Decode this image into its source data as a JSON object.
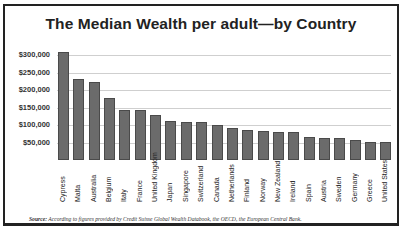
{
  "chart_data": {
    "type": "bar",
    "title": "The Median Wealth per adult—by Country",
    "xlabel": "",
    "ylabel": "",
    "ylim": [
      0,
      300000
    ],
    "yticks": [
      "$50,000",
      "$100,000",
      "$150,000",
      "$200,000",
      "$250,000",
      "$300,000"
    ],
    "ytick_values": [
      50000,
      100000,
      150000,
      200000,
      250000,
      300000
    ],
    "grid": true,
    "legend": null,
    "categories": [
      "Cypress",
      "Malta",
      "Australia",
      "Belgium",
      "Italy",
      "France",
      "United Kingdom",
      "Japan",
      "Singapore",
      "Switzerland",
      "Canada",
      "Netherlands",
      "Finland",
      "Norway",
      "New Zealand",
      "Ireland",
      "Spain",
      "Austria",
      "Sweden",
      "Germany",
      "Greece",
      "United States"
    ],
    "values": [
      310000,
      232000,
      224000,
      176000,
      142000,
      142000,
      129000,
      112000,
      109000,
      109000,
      101000,
      91000,
      87000,
      83000,
      81000,
      81000,
      67000,
      64000,
      64000,
      56000,
      51000,
      51000
    ]
  },
  "source": {
    "label": "Source:",
    "text": " According to figures provided by Credit Suisse Global Wealth Databook, the OECD, the European Central Bank."
  }
}
